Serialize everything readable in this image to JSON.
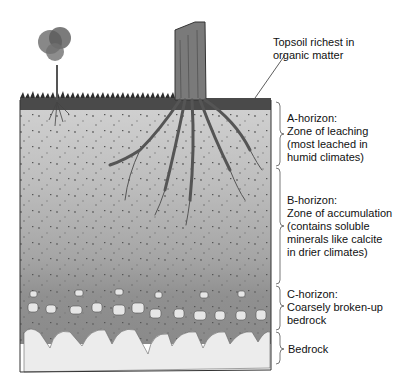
{
  "diagram": {
    "labels": {
      "topsoil": "Topsoil richest in\norganic matter",
      "a_horizon": "A-horizon:\nZone of leaching\n(most leached in\nhumid climates)",
      "b_horizon": "B-horizon:\nZone of accumulation\n(contains soluble\nminerals like calcite\nin drier climates)",
      "c_horizon": "C-horizon:\nCoarsely broken-up\nbedrock",
      "bedrock": "Bedrock"
    },
    "colors": {
      "topsoil": "#3a3a3a",
      "a_horizon": "#c9c9c9",
      "b_horizon": "#a8a8a8",
      "c_horizon": "#8a8a8a",
      "bedrock": "#e8e8e8",
      "outline": "#333333"
    }
  }
}
